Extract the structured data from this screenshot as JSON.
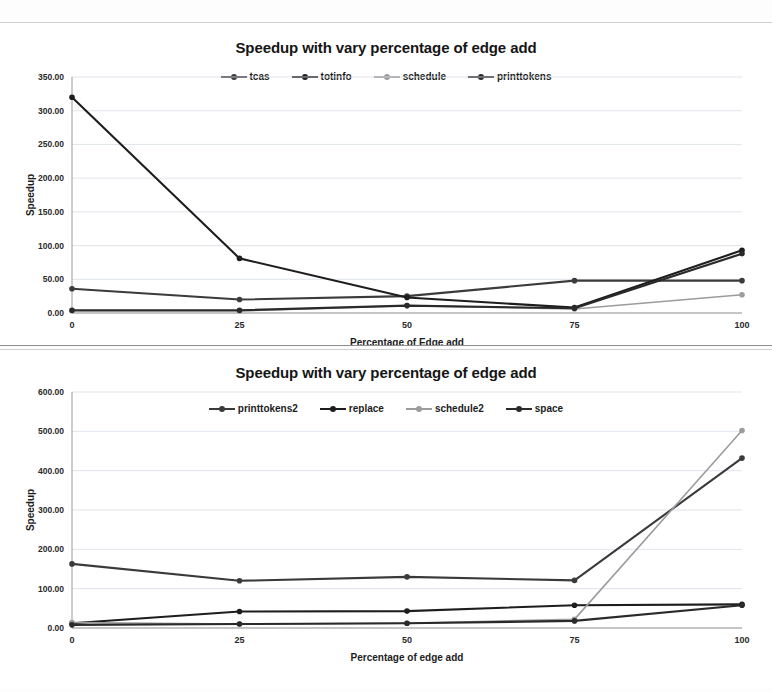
{
  "page": {
    "background": "#ffffff",
    "ink": "#1a1a1a"
  },
  "charts": [
    {
      "id": "top",
      "title": "Speedup with vary percentage of edge add",
      "xlabel": "Percentage of Edge add",
      "ylabel": "Speedup",
      "ylim": [
        0,
        350
      ],
      "ytick_step": 50,
      "ytick_labels": [
        "0.00",
        "50.00",
        "100.00",
        "150.00",
        "200.00",
        "250.00",
        "300.00",
        "350.00"
      ],
      "xtick_labels": [
        "0",
        "25",
        "50",
        "75",
        "100"
      ],
      "legend_position": "top-center",
      "grid": true,
      "series": [
        {
          "name": "tcas",
          "color": "#3b3b3b",
          "values": [
            36,
            20,
            25,
            48,
            48
          ]
        },
        {
          "name": "totinfo",
          "color": "#1d1d1d",
          "values": [
            320,
            81,
            23,
            8,
            93
          ]
        },
        {
          "name": "schedule",
          "color": "#9c9c9c",
          "values": [
            3,
            3,
            11,
            6,
            27
          ]
        },
        {
          "name": "printtokens",
          "color": "#2a2a2a",
          "values": [
            4,
            4,
            11,
            7,
            88
          ]
        }
      ]
    },
    {
      "id": "bottom",
      "title": "Speedup with vary percentage of edge add",
      "xlabel": "Percentage of edge add",
      "ylabel": "Speedup",
      "ylim": [
        0,
        600
      ],
      "ytick_step": 100,
      "ytick_labels": [
        "0.00",
        "100.00",
        "200.00",
        "300.00",
        "400.00",
        "500.00",
        "600.00"
      ],
      "xtick_labels": [
        "0",
        "25",
        "50",
        "75",
        "100"
      ],
      "legend_position": "top-center",
      "grid": true,
      "series": [
        {
          "name": "printtokens2",
          "color": "#3a3a3a",
          "values": [
            163,
            120,
            130,
            121,
            432
          ]
        },
        {
          "name": "replace",
          "color": "#1d1d1d",
          "values": [
            12,
            42,
            43,
            58,
            60
          ]
        },
        {
          "name": "schedule2",
          "color": "#9c9c9c",
          "values": [
            14,
            10,
            12,
            22,
            502
          ]
        },
        {
          "name": "space",
          "color": "#2a2a2a",
          "values": [
            8,
            10,
            12,
            18,
            58
          ]
        }
      ]
    }
  ],
  "chart_data": [
    {
      "type": "line",
      "title": "Speedup with vary percentage of edge add",
      "xlabel": "Percentage of Edge add",
      "ylabel": "Speedup",
      "x": [
        0,
        25,
        50,
        75,
        100
      ],
      "categories": [
        "0",
        "25",
        "50",
        "75",
        "100"
      ],
      "ylim": [
        0,
        350
      ],
      "xlim": [
        0,
        100
      ],
      "grid": true,
      "legend": "top-center",
      "series": [
        {
          "name": "tcas",
          "values": [
            36,
            20,
            25,
            48,
            48
          ]
        },
        {
          "name": "totinfo",
          "values": [
            320,
            81,
            23,
            8,
            93
          ]
        },
        {
          "name": "schedule",
          "values": [
            3,
            3,
            11,
            6,
            27
          ]
        },
        {
          "name": "printtokens",
          "values": [
            4,
            4,
            11,
            7,
            88
          ]
        }
      ]
    },
    {
      "type": "line",
      "title": "Speedup with vary percentage of edge add",
      "xlabel": "Percentage of edge add",
      "ylabel": "Speedup",
      "x": [
        0,
        25,
        50,
        75,
        100
      ],
      "categories": [
        "0",
        "25",
        "50",
        "75",
        "100"
      ],
      "ylim": [
        0,
        600
      ],
      "xlim": [
        0,
        100
      ],
      "grid": true,
      "legend": "top-center",
      "series": [
        {
          "name": "printtokens2",
          "values": [
            163,
            120,
            130,
            121,
            432
          ]
        },
        {
          "name": "replace",
          "values": [
            12,
            42,
            43,
            58,
            60
          ]
        },
        {
          "name": "schedule2",
          "values": [
            14,
            10,
            12,
            22,
            502
          ]
        },
        {
          "name": "space",
          "values": [
            8,
            10,
            12,
            18,
            58
          ]
        }
      ]
    }
  ]
}
